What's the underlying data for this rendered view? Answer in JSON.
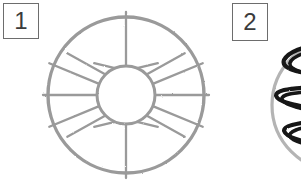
{
  "figure": {
    "width": 301,
    "height": 183,
    "background_color": "#ffffff",
    "style": "hand-drawn scanned line diagram, grayscale"
  },
  "panels": [
    {
      "id": "panel-1",
      "label": "1",
      "label_box": {
        "x": 3,
        "y": 3,
        "width": 36,
        "height": 36,
        "border_color": "#6d6d6d"
      },
      "drawing": {
        "name": "spoked-annulus",
        "description": "ring / wheel with radial spokes between an inner circle and an outer circle",
        "stroke_color": "#9a9a9a",
        "center_x": 126,
        "center_y": 95,
        "outer_radius": 78,
        "inner_radius": 29,
        "spoke_count": 16,
        "spoke_overshoot": 5
      }
    },
    {
      "id": "panel-2",
      "label": "2",
      "label_box": {
        "x": 232,
        "y": 3,
        "width": 36,
        "height": 38,
        "border_color": "#6d6d6d"
      },
      "drawing": {
        "name": "zigzag-in-circle",
        "description": "light gray circle, cropped by the right image edge, containing a bold black vertical zigzag / serpentine scribble",
        "circle_stroke_color": "#b4b4b4",
        "zigzag_stroke_color": "#141414",
        "center_x": 338,
        "center_y": 105,
        "radius": 66,
        "zigzag_sweeps": 6
      }
    }
  ]
}
